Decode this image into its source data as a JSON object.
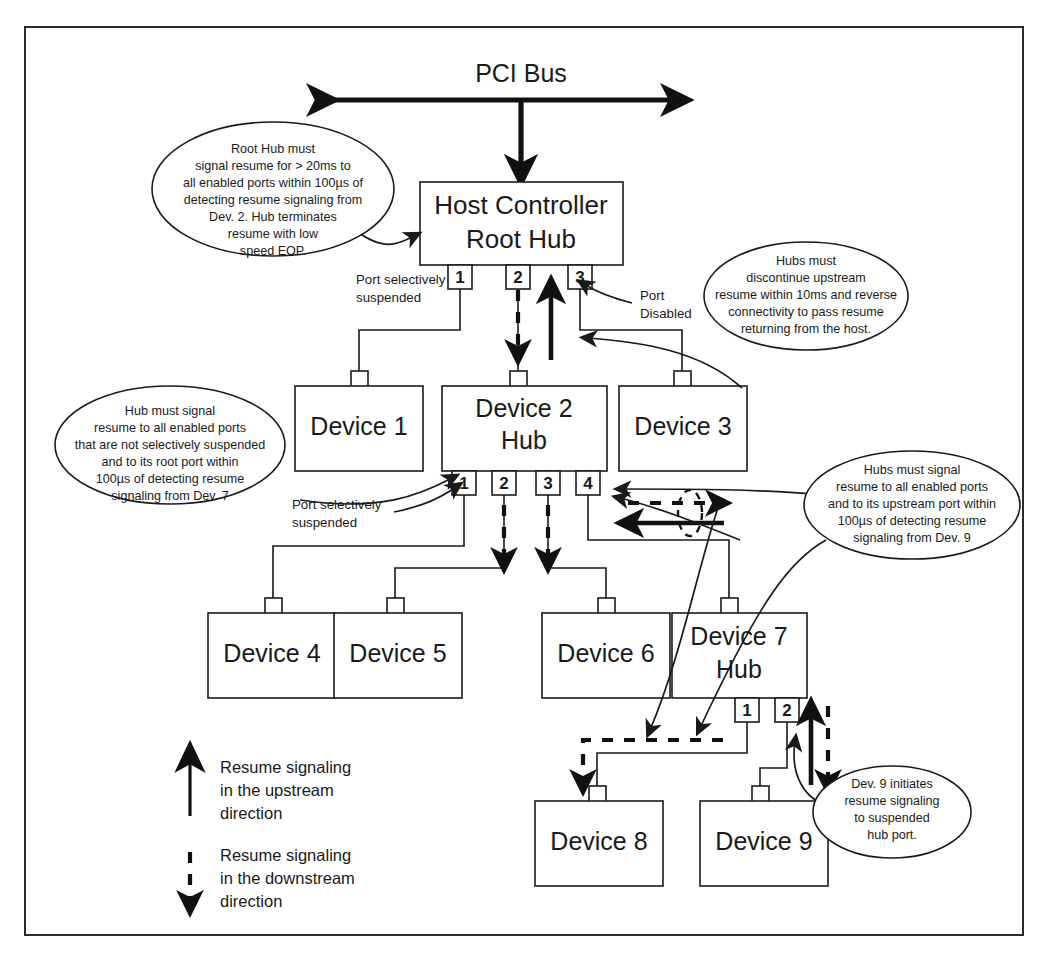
{
  "diagram": {
    "title_bus": "PCI Bus",
    "host": {
      "line1": "Host Controller",
      "line2": "Root Hub"
    },
    "devices": [
      {
        "id": "device-1",
        "line1": "Device 1",
        "line2": ""
      },
      {
        "id": "device-2",
        "line1": "Device 2",
        "line2": "Hub"
      },
      {
        "id": "device-3",
        "line1": "Device 3",
        "line2": ""
      },
      {
        "id": "device-4",
        "line1": "Device 4",
        "line2": ""
      },
      {
        "id": "device-5",
        "line1": "Device 5",
        "line2": ""
      },
      {
        "id": "device-6",
        "line1": "Device 6",
        "line2": ""
      },
      {
        "id": "device-7",
        "line1": "Device 7",
        "line2": "Hub"
      },
      {
        "id": "device-8",
        "line1": "Device 8",
        "line2": ""
      },
      {
        "id": "device-9",
        "line1": "Device 9",
        "line2": ""
      }
    ],
    "root_hub_ports": [
      "1",
      "2",
      "3"
    ],
    "device2_ports": [
      "1",
      "2",
      "3",
      "4"
    ],
    "device7_ports": [
      "1",
      "2"
    ],
    "annotations": {
      "root_port_suspended": [
        "Port selectively",
        "suspended"
      ],
      "root_port_disabled": [
        "Port",
        "Disabled"
      ],
      "hub2_port_suspended": [
        "Port selectively",
        "suspended"
      ]
    },
    "callouts": [
      {
        "id": "callout-root-hub",
        "lines": [
          "Root Hub must",
          "signal resume for >  20ms to",
          "all enabled ports within 100µs of",
          "detecting resume signaling from",
          "Dev. 2. Hub terminates",
          "resume with low",
          "speed EOP."
        ]
      },
      {
        "id": "callout-hubs-discontinue",
        "lines": [
          "Hubs must",
          "discontinue upstream",
          "resume within 10ms and reverse",
          "connectivity to pass resume",
          "returning from the host."
        ]
      },
      {
        "id": "callout-hub-signal-dev7",
        "lines": [
          "Hub must signal",
          "resume to all enabled ports",
          "that are not selectively suspended",
          "and to its root port within",
          "100µs of detecting resume",
          "signaling from Dev. 7"
        ]
      },
      {
        "id": "callout-hubs-signal-dev9",
        "lines": [
          "Hubs must signal",
          "resume to all enabled ports",
          "and to its upstream port within",
          "100µs of detecting resume",
          "signaling from Dev. 9"
        ]
      },
      {
        "id": "callout-dev9-initiates",
        "lines": [
          "Dev. 9 initiates",
          "resume signaling",
          "to suspended",
          "hub port."
        ]
      }
    ],
    "legend": [
      {
        "id": "legend-upstream",
        "style": "solid",
        "icon": "up-arrow-icon",
        "lines": [
          "Resume signaling",
          "in the upstream",
          "direction"
        ]
      },
      {
        "id": "legend-downstream",
        "style": "dashed",
        "icon": "down-arrow-dashed-icon",
        "lines": [
          "Resume signaling",
          "in the downstream",
          "direction"
        ]
      }
    ],
    "colors": {
      "ink": "#1a1a1a",
      "arrow": "#111111",
      "frame": "#2b2b2b",
      "paper": "#ffffff"
    }
  }
}
